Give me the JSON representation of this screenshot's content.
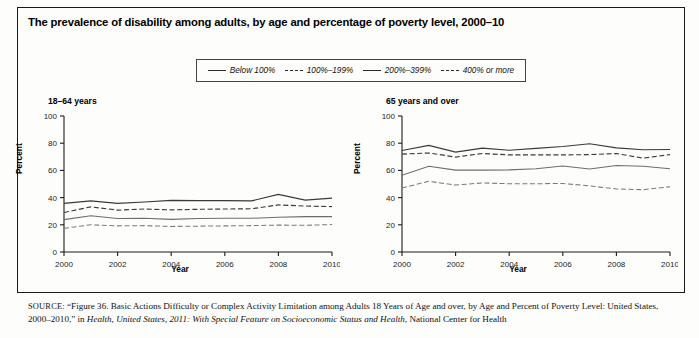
{
  "figure": {
    "title": "The prevalence of disability among adults, by age and percentage of poverty level, 2000–10",
    "border_color": "#1a1a1a",
    "background": "#fdfdfb"
  },
  "legend": {
    "items": [
      {
        "label": "Below 100%",
        "style": "solid",
        "icon": "line-solid-icon"
      },
      {
        "label": "100%–199%",
        "style": "dashed",
        "icon": "line-dashed-icon"
      },
      {
        "label": "200%–399%",
        "style": "solid",
        "icon": "line-solid-icon"
      },
      {
        "label": "400% or more",
        "style": "dashed",
        "icon": "line-dashed-icon"
      }
    ]
  },
  "source": {
    "prefix": "SOURCE:",
    "line1": "“Figure 36. Basic Actions Difficulty or Complex Activity Limitation among Adults 18 Years of Age and over, by Age and Percent of Poverty",
    "line2_pre": "Level: United States, 2000–2010,” in ",
    "line2_italic": "Health, United States, 2011: With Special Feature on Socioeconomic Status and Health",
    "line2_post": ", National Center for Health"
  },
  "chart_data": [
    {
      "type": "line",
      "title": "18–64 years",
      "xlabel": "Year",
      "ylabel": "Percent",
      "ylim": [
        0,
        100
      ],
      "yticks": [
        0,
        20,
        40,
        60,
        80,
        100
      ],
      "xlim": [
        2000,
        2010
      ],
      "xticks": [
        2000,
        2002,
        2004,
        2006,
        2008,
        2010
      ],
      "xtick_labels": [
        "2000",
        "2002",
        "2004",
        "2006",
        "2008",
        "2010"
      ],
      "grid": false,
      "legend_position": "top-center-shared",
      "x": [
        2000,
        2001,
        2002,
        2003,
        2004,
        2005,
        2006,
        2007,
        2008,
        2009,
        2010
      ],
      "series": [
        {
          "name": "Below 100%",
          "style": "solid",
          "values": [
            35.8,
            37.6,
            35.8,
            36.8,
            38.0,
            37.8,
            37.8,
            37.6,
            42.4,
            38.2,
            39.6
          ]
        },
        {
          "name": "100%–199%",
          "style": "dashed",
          "values": [
            29.0,
            33.2,
            30.8,
            31.6,
            31.0,
            31.4,
            31.6,
            31.8,
            34.6,
            33.8,
            33.4
          ]
        },
        {
          "name": "200%–399%",
          "style": "solid",
          "values": [
            23.8,
            26.6,
            24.6,
            24.8,
            24.0,
            24.6,
            24.8,
            24.8,
            25.6,
            26.0,
            26.0
          ]
        },
        {
          "name": "400% or more",
          "style": "dashed",
          "values": [
            17.4,
            20.0,
            19.2,
            19.4,
            18.8,
            19.0,
            19.2,
            19.4,
            19.8,
            19.6,
            20.2
          ]
        }
      ]
    },
    {
      "type": "line",
      "title": "65 years and over",
      "xlabel": "Year",
      "ylabel": "Percent",
      "ylim": [
        0,
        100
      ],
      "yticks": [
        0,
        20,
        40,
        60,
        80,
        100
      ],
      "xlim": [
        2000,
        2010
      ],
      "xticks": [
        2000,
        2002,
        2004,
        2006,
        2008,
        2010
      ],
      "xtick_labels": [
        "2000",
        "2002",
        "2004",
        "2006",
        "2008",
        "2010"
      ],
      "grid": false,
      "legend_position": "top-center-shared",
      "x": [
        2000,
        2001,
        2002,
        2003,
        2004,
        2005,
        2006,
        2007,
        2008,
        2009,
        2010
      ],
      "series": [
        {
          "name": "Below 100%",
          "style": "solid",
          "values": [
            74.6,
            78.4,
            73.4,
            76.4,
            74.8,
            76.2,
            77.6,
            79.6,
            76.6,
            75.2,
            75.4
          ]
        },
        {
          "name": "100%–199%",
          "style": "dashed",
          "values": [
            72.0,
            72.8,
            69.8,
            72.4,
            71.4,
            71.4,
            71.4,
            71.6,
            72.4,
            69.0,
            71.6
          ]
        },
        {
          "name": "200%–399%",
          "style": "solid",
          "values": [
            56.4,
            63.0,
            60.2,
            60.2,
            60.4,
            61.2,
            63.2,
            61.0,
            63.6,
            63.0,
            61.2
          ]
        },
        {
          "name": "400% or more",
          "style": "dashed",
          "values": [
            47.0,
            52.0,
            49.2,
            50.8,
            50.2,
            50.2,
            50.4,
            48.6,
            46.4,
            45.8,
            48.0
          ]
        }
      ]
    }
  ]
}
